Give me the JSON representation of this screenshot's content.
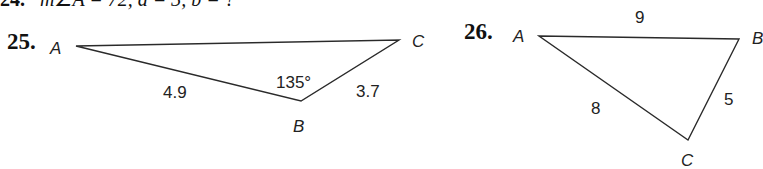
{
  "previous_problem": {
    "number": "24.",
    "text": "m∠A = 72, a = 3, b = ?"
  },
  "problems": [
    {
      "number": "25.",
      "vertices": {
        "A": "A",
        "B": "B",
        "C": "C"
      },
      "sides": {
        "AB": "4.9",
        "BC": "3.7"
      },
      "angle_B": "135°"
    },
    {
      "number": "26.",
      "vertices": {
        "A": "A",
        "B": "B",
        "C": "C"
      },
      "sides": {
        "AB": "9",
        "BC": "5",
        "AC": "8"
      }
    }
  ],
  "colors": {
    "line": "#2a2a2a",
    "text": "#222222"
  }
}
